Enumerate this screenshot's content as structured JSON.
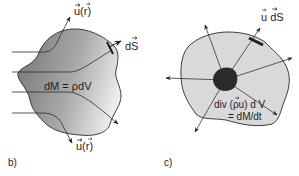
{
  "figure": {
    "colors": {
      "background": "#ffffff",
      "panel_b_fill_dark": "#7d7d7d",
      "panel_b_fill_light": "#e6e6e6",
      "panel_c_fill": "#d9d9d9",
      "core_fill": "#2a2a2a",
      "stroke": "#2b2b2b"
    },
    "panel_b": {
      "label": "b)",
      "velocity_top": "u(r)",
      "velocity_bottom": "u(r)",
      "surface_element": "dS",
      "mass_element": "dM = ρdV"
    },
    "panel_c": {
      "label": "c)",
      "flux_element": "u dS",
      "divergence_line1": "div (ρu) d V",
      "divergence_line2": "= dM/dt"
    }
  }
}
